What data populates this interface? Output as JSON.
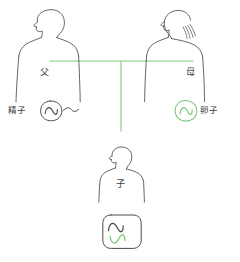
{
  "diagram": {
    "title": "",
    "type": "inheritance-pedigree",
    "background_color": "#ffffff",
    "ink_color": "#4a4a4a",
    "pedigree_line_color": "#a8dca8",
    "maternal_color": "#7ac97a",
    "paternal_color": "#4a4a4a"
  },
  "father": {
    "label": "父",
    "figure_name": "father-silhouette",
    "gamete": {
      "label": "精子",
      "cell_name": "sperm-cell",
      "wave_glyph": "~",
      "tail_glyph": "~",
      "outline_color": "#4a4a4a",
      "wave_color": "#4a4a4a"
    }
  },
  "mother": {
    "label": "母",
    "figure_name": "mother-silhouette",
    "gamete": {
      "label": "卵子",
      "cell_name": "ovum-cell",
      "wave_glyph": "~",
      "outline_color": "#7ac97a",
      "wave_color": "#7ac97a"
    }
  },
  "child": {
    "label": "子",
    "figure_name": "child-silhouette",
    "zygote": {
      "cell_name": "zygote-cell",
      "paternal_wave_glyph": "~",
      "maternal_wave_glyph": "~",
      "paternal_wave_color": "#4a4a4a",
      "maternal_wave_color": "#7ac97a",
      "outline_color": "#4a4a4a"
    }
  },
  "pedigree": {
    "horizontal_line_name": "parents-union-line",
    "vertical_line_name": "descent-line",
    "color": "#a8dca8"
  }
}
